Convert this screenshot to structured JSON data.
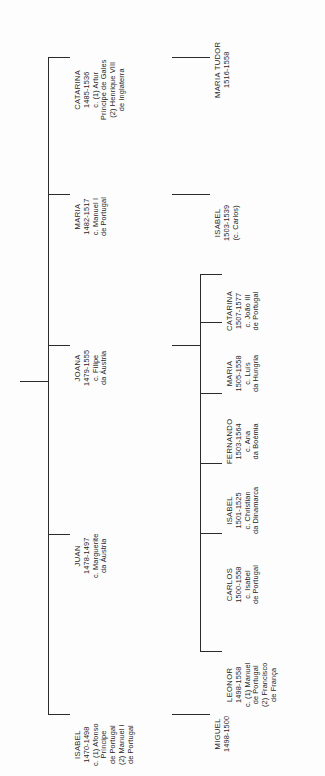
{
  "diagram": {
    "type": "genealogy-tree",
    "orientation": "rotated-90-ccw",
    "line_color": "#2b2b2b",
    "background_color": "#ffffff"
  },
  "generation1": {
    "label": "Filhos",
    "people": [
      {
        "id": "isabel-1470",
        "name": "ISABEL",
        "dates": "1470-1498",
        "spouses": [
          "c. (1) Afonso",
          "Príncipe",
          "de Portugal",
          "(2) Manuel I",
          "de Portugal"
        ]
      },
      {
        "id": "juan-1478",
        "name": "JUAN",
        "dates": "1478-1497",
        "spouses": [
          "c. Marguerite",
          "da Áustria"
        ]
      },
      {
        "id": "joana-1479",
        "name": "JOANA",
        "dates": "1479-1555",
        "spouses": [
          "c. Filipe",
          "da Áustria"
        ]
      },
      {
        "id": "maria-1482",
        "name": "MARIA",
        "dates": "1482-1517",
        "spouses": [
          "c. Manuel I",
          "de Portugal"
        ]
      },
      {
        "id": "catarina-1485",
        "name": "CATARINA",
        "dates": "1485-1536",
        "spouses": [
          "c. (1) Artur",
          "Príncipe de Gales",
          "(2) Henrique VIII",
          "de Inglaterra"
        ]
      }
    ]
  },
  "generation2": {
    "label": "Netos",
    "children_of_isabel": [
      {
        "id": "miguel-1498",
        "name": "MIGUEL",
        "dates": "1498-1500",
        "spouses": []
      }
    ],
    "children_of_joana": [
      {
        "id": "leonor-1498",
        "name": "LEONOR",
        "dates": "1498-1558",
        "spouses": [
          "c. (1) Manuel",
          "de Portugal",
          "(2) Francisco",
          "de França"
        ]
      },
      {
        "id": "carlos-1500",
        "name": "CARLOS",
        "dates": "1500-1558",
        "spouses": [
          "c. Isabel",
          "de Portugal"
        ]
      },
      {
        "id": "isabel-1501",
        "name": "ISABEL",
        "dates": "1501-1525",
        "spouses": [
          "c. Christian",
          "da Dinamarca"
        ]
      },
      {
        "id": "fernando-1503",
        "name": "FERNANDO",
        "dates": "1503-1564",
        "spouses": [
          "c. Ana",
          "da Boémia"
        ]
      },
      {
        "id": "maria-1505",
        "name": "MARIA",
        "dates": "1505-1558",
        "spouses": [
          "c. Luís",
          "da Hungria"
        ]
      },
      {
        "id": "catarina-1507",
        "name": "CATARINA",
        "dates": "1507-1577",
        "spouses": [
          "c. João III",
          "de Portugal"
        ]
      }
    ],
    "children_of_maria": [
      {
        "id": "isabel-1503",
        "name": "ISABEL",
        "dates": "1503-1539",
        "spouses": [
          "(c. Carlos)"
        ]
      }
    ],
    "children_of_catarina": [
      {
        "id": "maria-tudor-1516",
        "name": "MARIA TUDOR",
        "dates": "1516-1558",
        "spouses": []
      }
    ]
  }
}
